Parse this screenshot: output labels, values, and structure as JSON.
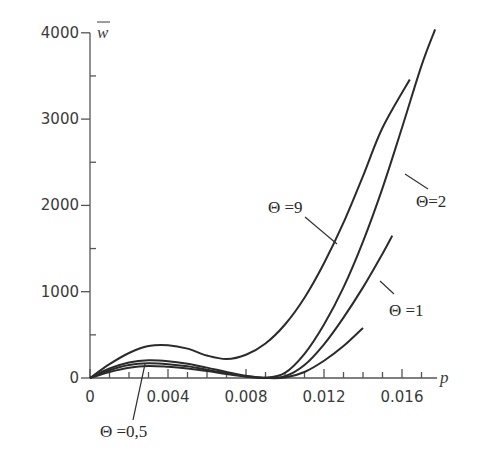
{
  "chart_data": {
    "type": "line",
    "title": "",
    "xlabel": "p",
    "ylabel": "w̄",
    "xlim": [
      0,
      0.018
    ],
    "ylim": [
      0,
      4000
    ],
    "grid": false,
    "legend": "inline labels with leader lines",
    "x_ticks": [
      0,
      0.004,
      0.008,
      0.012,
      0.016
    ],
    "x_tick_labels": [
      "0",
      "0.004",
      "0.008",
      "0.012",
      "0.016"
    ],
    "x_minor_step": 0.001,
    "y_ticks": [
      0,
      1000,
      2000,
      3000,
      4000
    ],
    "y_tick_labels": [
      "0",
      "1000",
      "2000",
      "3000",
      "4000"
    ],
    "y_minor_step": 500,
    "series": [
      {
        "name": "Θ =9",
        "theta": 9,
        "x": [
          0,
          0.001,
          0.002,
          0.003,
          0.004,
          0.005,
          0.006,
          0.007,
          0.008,
          0.009,
          0.01,
          0.011,
          0.012,
          0.013,
          0.014,
          0.015,
          0.0164
        ],
        "y": [
          0,
          160,
          290,
          370,
          380,
          340,
          260,
          220,
          270,
          400,
          620,
          930,
          1330,
          1800,
          2340,
          2900,
          3460
        ]
      },
      {
        "name": "Θ=2",
        "theta": 2,
        "x": [
          0,
          0.001,
          0.002,
          0.003,
          0.004,
          0.005,
          0.006,
          0.007,
          0.008,
          0.009,
          0.01,
          0.011,
          0.012,
          0.013,
          0.014,
          0.015,
          0.016,
          0.017,
          0.0177
        ],
        "y": [
          0,
          110,
          180,
          205,
          195,
          165,
          120,
          70,
          25,
          5,
          60,
          280,
          620,
          1050,
          1580,
          2200,
          2900,
          3620,
          4040
        ]
      },
      {
        "name": "Θ =1",
        "theta": 1,
        "x": [
          0,
          0.001,
          0.002,
          0.003,
          0.004,
          0.005,
          0.006,
          0.007,
          0.008,
          0.009,
          0.01,
          0.011,
          0.012,
          0.013,
          0.014,
          0.015,
          0.0155
        ],
        "y": [
          0,
          90,
          150,
          170,
          160,
          135,
          95,
          55,
          20,
          0,
          20,
          150,
          390,
          700,
          1050,
          1440,
          1650
        ]
      },
      {
        "name": "Θ =0,5",
        "theta": 0.5,
        "x": [
          0,
          0.001,
          0.002,
          0.003,
          0.004,
          0.005,
          0.006,
          0.007,
          0.008,
          0.009,
          0.01,
          0.011,
          0.012,
          0.013,
          0.014
        ],
        "y": [
          0,
          70,
          120,
          140,
          130,
          110,
          80,
          45,
          15,
          0,
          5,
          70,
          200,
          370,
          580
        ]
      }
    ],
    "annotations": [
      {
        "text": "Θ =9",
        "series": "Θ =9"
      },
      {
        "text": "Θ=2",
        "series": "Θ=2"
      },
      {
        "text": "Θ =1",
        "series": "Θ =1"
      },
      {
        "text": "Θ =0,5",
        "series": "Θ =0,5"
      }
    ]
  },
  "labels": {
    "x_axis": "p",
    "y_axis": "w",
    "theta9": "Θ =9",
    "theta2": "Θ=2",
    "theta1": "Θ =1",
    "theta05": "Θ =0,5"
  }
}
